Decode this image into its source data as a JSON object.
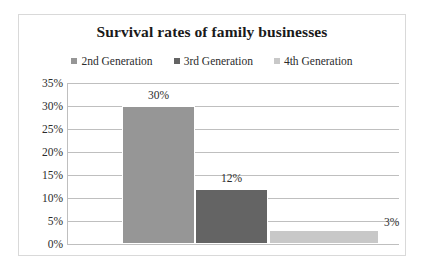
{
  "chart_data": {
    "type": "bar",
    "title": "Survival rates of family businesses",
    "categories": [
      "2nd Generation",
      "3rd Generation",
      "4th Generation"
    ],
    "values": [
      30,
      12,
      3
    ],
    "value_labels": [
      "30%",
      "12%",
      "3%"
    ],
    "xlabel": "",
    "ylabel": "",
    "ylim": [
      0,
      35
    ],
    "ytick_labels": [
      "35%",
      "30%",
      "25%",
      "20%",
      "15%",
      "10%",
      "5%",
      "0%"
    ],
    "ytick_values": [
      35,
      30,
      25,
      20,
      15,
      10,
      5,
      0
    ],
    "grid": true,
    "legend_position": "top",
    "series": [
      {
        "name": "2nd Generation",
        "value": 30,
        "label": "30%",
        "color": "#969696"
      },
      {
        "name": "3rd Generation",
        "value": 12,
        "label": "12%",
        "color": "#646464"
      },
      {
        "name": "4th Generation",
        "value": 3,
        "label": "3%",
        "color": "#c8c8c8"
      }
    ]
  },
  "legend": {
    "items": [
      {
        "label": "2nd Generation",
        "color": "#969696"
      },
      {
        "label": "3rd Generation",
        "color": "#646464"
      },
      {
        "label": "4th Generation",
        "color": "#c8c8c8"
      }
    ]
  },
  "colors": {
    "frame_border": "#d9d9d9",
    "gridline": "#bfbfbf",
    "text": "#2b2b2b",
    "title": "#1a1a1a",
    "background": "#ffffff"
  }
}
